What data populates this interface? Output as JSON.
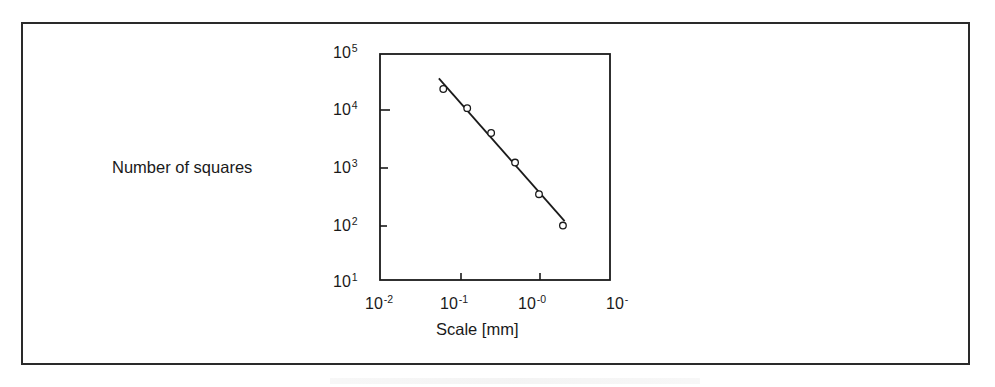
{
  "chart_data": {
    "type": "scatter",
    "title": "",
    "xlabel": "Scale [mm]",
    "ylabel": "Number of squares",
    "xscale": "log",
    "yscale": "log",
    "xlim": [
      0.01,
      7
    ],
    "ylim": [
      10,
      100000
    ],
    "grid": false,
    "legend": null,
    "x_tick_labels": [
      {
        "base": "1",
        "mantissa": "0",
        "exp": "-2"
      },
      {
        "base": "10",
        "exp": "-1"
      },
      {
        "base": "10",
        "exp": "-0"
      },
      {
        "base": "10",
        "exp": "-"
      }
    ],
    "y_tick_labels": [
      {
        "base": "10",
        "exp": "5"
      },
      {
        "base": "10",
        "exp": "4"
      },
      {
        "base": "10",
        "exp": "3"
      },
      {
        "base": "10",
        "exp": "2"
      },
      {
        "base": "10",
        "exp": "1"
      }
    ],
    "series": [
      {
        "name": "measured",
        "marker": "open-circle",
        "x": [
          0.0625,
          0.125,
          0.25,
          0.5,
          1.0,
          2.0
        ],
        "y": [
          24000,
          11000,
          4000,
          1200,
          330,
          92
        ]
      },
      {
        "name": "power-law fit",
        "marker": "line",
        "x": [
          0.055,
          2.1
        ],
        "y": [
          37000,
          110
        ]
      }
    ]
  },
  "labels": {
    "ylabel": "Number of squares",
    "xlabel": "Scale [mm]"
  },
  "ticks": {
    "y": [
      {
        "base": "10",
        "exp": "5"
      },
      {
        "base": "10",
        "exp": "4"
      },
      {
        "base": "10",
        "exp": "3"
      },
      {
        "base": "10",
        "exp": "2"
      },
      {
        "base": "10",
        "exp": "1"
      }
    ],
    "x": [
      {
        "base": "10",
        "exp": "-2"
      },
      {
        "base": "10",
        "exp": "-1"
      },
      {
        "base": "10",
        "exp": "-0"
      },
      {
        "base": "10",
        "exp": "-"
      }
    ]
  },
  "colors": {
    "ink": "#1a1a1a",
    "frame": "#2a2a2a",
    "background": "#ffffff"
  }
}
